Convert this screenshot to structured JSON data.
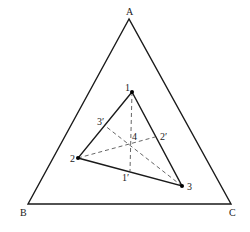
{
  "diagram": {
    "type": "ternary-phase-diagram",
    "outer_triangle": {
      "vertices": [
        {
          "label": "A",
          "x": 129,
          "y": 19,
          "label_x": 126,
          "label_y": 15
        },
        {
          "label": "B",
          "x": 28,
          "y": 204,
          "label_x": 20,
          "label_y": 216
        },
        {
          "label": "C",
          "x": 231,
          "y": 204,
          "label_x": 229,
          "label_y": 216
        }
      ]
    },
    "inner_triangle": {
      "points": [
        {
          "label": "1",
          "x": 132,
          "y": 92,
          "label_x": 125,
          "label_y": 91
        },
        {
          "label": "2",
          "x": 78,
          "y": 158,
          "label_x": 70,
          "label_y": 162
        },
        {
          "label": "3",
          "x": 182,
          "y": 186,
          "label_x": 187,
          "label_y": 190
        }
      ]
    },
    "center_point": {
      "label": "4",
      "x": 130,
      "y": 143,
      "label_x": 132,
      "label_y": 140
    },
    "foot_points": [
      {
        "label": "1′",
        "x": 130,
        "y": 171,
        "label_x": 122,
        "label_y": 181
      },
      {
        "label": "2′",
        "x": 155,
        "y": 137,
        "label_x": 160,
        "label_y": 140
      },
      {
        "label": "3′",
        "x": 104,
        "y": 125,
        "label_x": 97,
        "label_y": 125
      }
    ],
    "dashed_lines": [
      {
        "from": "1",
        "to": "1′"
      },
      {
        "from": "2",
        "to": "2′"
      },
      {
        "from": "3",
        "to": "3′"
      }
    ],
    "colors": {
      "line": "#1a1a1a",
      "dash": "#555555",
      "background": "#ffffff"
    }
  }
}
